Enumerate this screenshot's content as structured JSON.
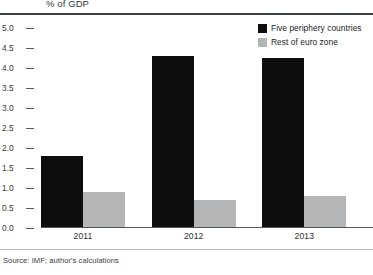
{
  "chart_data": {
    "type": "bar",
    "title": "% of GDP",
    "xlabel": "",
    "ylabel": "% of GDP",
    "categories": [
      "2011",
      "2012",
      "2013"
    ],
    "series": [
      {
        "name": "Five periphery countries",
        "color": "#0d0d0d",
        "values": [
          1.8,
          4.3,
          4.25
        ]
      },
      {
        "name": "Rest of euro zone",
        "color": "#b3b5b6",
        "values": [
          0.9,
          0.7,
          0.8
        ]
      }
    ],
    "ylim": [
      0.0,
      5.0
    ],
    "ytick_labels": [
      "5.0",
      "4.5",
      "4.0",
      "3.5",
      "3.0",
      "2.5",
      "2.0",
      "1.5",
      "1.0",
      "0.5",
      "0.0"
    ],
    "ytick_values": [
      5.0,
      4.5,
      4.0,
      3.5,
      3.0,
      2.5,
      2.0,
      1.5,
      1.0,
      0.5,
      0.0
    ],
    "grid": false,
    "legend_position": "top-right",
    "source": "Source: IMF; author's calculations"
  },
  "legend": {
    "entries": [
      {
        "label": "Five periphery countries",
        "swatch": "#0d0d0d"
      },
      {
        "label": "Rest of euro zone",
        "swatch": "#b3b5b6"
      }
    ]
  },
  "footer": {
    "source": "Source: IMF; author's calculations"
  }
}
